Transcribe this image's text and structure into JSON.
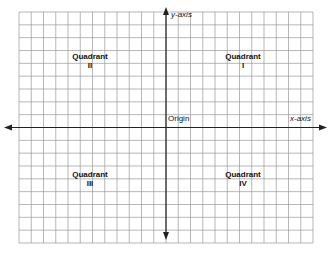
{
  "diagram": {
    "grid": {
      "left": 19,
      "top": 12,
      "right": 313,
      "bottom": 243,
      "cols": 24,
      "rows": 18,
      "line_color": "#9a9a9a"
    },
    "axes": {
      "color": "#222222",
      "x_axis_label": "x-axis",
      "y_axis_label": "y-axis",
      "origin_label": "Origin"
    },
    "quadrants": [
      {
        "id": "I",
        "label": "Quadrant",
        "numeral": "I"
      },
      {
        "id": "II",
        "label": "Quadrant",
        "numeral": "II"
      },
      {
        "id": "III",
        "label": "Quadrant",
        "numeral": "III"
      },
      {
        "id": "IV",
        "label": "Quadrant",
        "numeral": "IV"
      }
    ]
  }
}
